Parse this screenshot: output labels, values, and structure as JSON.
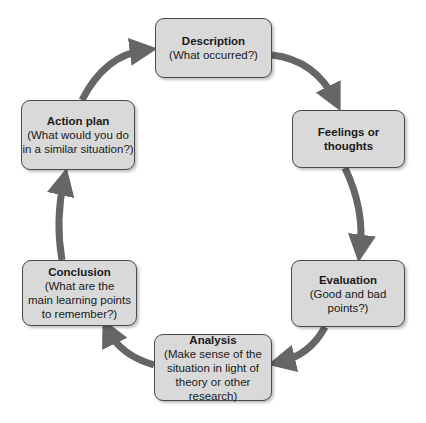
{
  "diagram": {
    "type": "cycle",
    "colors": {
      "box_fill": "#d9d9d9",
      "box_border": "#4a4a4a",
      "arrow": "#666666"
    },
    "nodes": [
      {
        "id": "description",
        "title": "Description",
        "subtitle": "(What occurred?)"
      },
      {
        "id": "feelings",
        "title": "Feelings or\nthoughts",
        "subtitle": ""
      },
      {
        "id": "evaluation",
        "title": "Evaluation",
        "subtitle": "(Good and bad\npoints?)"
      },
      {
        "id": "analysis",
        "title": "Analysis",
        "subtitle": "(Make sense of the\nsituation in light of\ntheory or other research)"
      },
      {
        "id": "conclusion",
        "title": "Conclusion",
        "subtitle": "(What are the\nmain learning points\nto remember?)"
      },
      {
        "id": "action_plan",
        "title": "Action plan",
        "subtitle": "(What would you do\nin a similar situation?)"
      }
    ],
    "edges": [
      [
        "description",
        "feelings"
      ],
      [
        "feelings",
        "evaluation"
      ],
      [
        "evaluation",
        "analysis"
      ],
      [
        "analysis",
        "conclusion"
      ],
      [
        "conclusion",
        "action_plan"
      ],
      [
        "action_plan",
        "description"
      ]
    ]
  }
}
